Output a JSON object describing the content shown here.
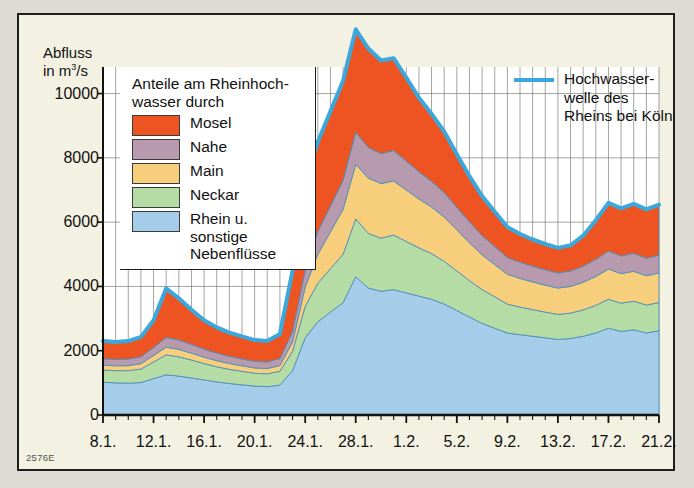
{
  "figure": {
    "code": "2576E",
    "background": "#f3f1e2",
    "frame_color": "#1d1d1b"
  },
  "legend_left": {
    "title": "Anteile am Rheinhoch-\nwasser durch",
    "items": [
      {
        "label": "Mosel",
        "color": "#ee5422"
      },
      {
        "label": "Nahe",
        "color": "#b79aad"
      },
      {
        "label": "Main",
        "color": "#f7cf7c"
      },
      {
        "label": "Neckar",
        "color": "#b6dca6"
      },
      {
        "label": "Rhein u. sonstige\nNebenflüsse",
        "color": "#a5cce9"
      }
    ]
  },
  "legend_right": {
    "label": "Hochwasser-\nwelle des\nRheins bei Köln",
    "color": "#3aa8dc"
  },
  "chart_data": {
    "type": "area",
    "stacked": true,
    "title": "",
    "ylabel": "Abfluss\nin m3/s",
    "ylabel_html": "Abfluss in m<sup>3</sup>/s",
    "xlabel": "",
    "ylim": [
      0,
      11200
    ],
    "yticks": [
      0,
      2000,
      4000,
      6000,
      8000,
      10000
    ],
    "ytick_labels": [
      "0",
      "2000",
      "4000",
      "6000",
      "8000",
      "10000"
    ],
    "grid": true,
    "grid_x": "every day",
    "grid_y": "every 2000",
    "x": [
      "8.1.",
      "9.1.",
      "10.1.",
      "11.1.",
      "12.1.",
      "13.1.",
      "14.1.",
      "15.1.",
      "16.1.",
      "17.1.",
      "18.1.",
      "19.1.",
      "20.1.",
      "21.1.",
      "22.1.",
      "23.1.",
      "24.1.",
      "25.1.",
      "26.1.",
      "27.1.",
      "28.1.",
      "29.1.",
      "30.1.",
      "31.1.",
      "1.2.",
      "2.2.",
      "3.2.",
      "4.2.",
      "5.2.",
      "6.2.",
      "7.2.",
      "8.2.",
      "9.2.",
      "10.2.",
      "11.2.",
      "12.2.",
      "13.2.",
      "14.2.",
      "15.2.",
      "16.2.",
      "17.2.",
      "18.2.",
      "19.2.",
      "20.2.",
      "21.2."
    ],
    "xtick_labels": [
      "8.1.",
      "12.1.",
      "16.1.",
      "20.1.",
      "24.1.",
      "28.1.",
      "1.2.",
      "5.2.",
      "9.2.",
      "13.2.",
      "17.2.",
      "21.2."
    ],
    "xtick_every": 4,
    "series": [
      {
        "name": "Rhein u. sonstige Nebenflüsse",
        "color": "#a5cce9",
        "values": [
          1020,
          1000,
          990,
          1010,
          1130,
          1250,
          1210,
          1150,
          1090,
          1030,
          980,
          940,
          900,
          880,
          930,
          1380,
          2400,
          2900,
          3200,
          3500,
          4300,
          3950,
          3850,
          3900,
          3800,
          3700,
          3600,
          3450,
          3250,
          3050,
          2850,
          2700,
          2550,
          2500,
          2450,
          2400,
          2350,
          2380,
          2450,
          2550,
          2700,
          2600,
          2650,
          2550,
          2620
        ]
      },
      {
        "name": "Neckar",
        "color": "#b6dca6",
        "values": [
          380,
          380,
          390,
          420,
          520,
          620,
          600,
          560,
          510,
          470,
          440,
          420,
          400,
          400,
          430,
          600,
          980,
          1200,
          1350,
          1500,
          1800,
          1700,
          1650,
          1700,
          1600,
          1500,
          1420,
          1330,
          1230,
          1130,
          1050,
          980,
          900,
          860,
          830,
          800,
          780,
          790,
          820,
          860,
          900,
          880,
          890,
          870,
          880
        ]
      },
      {
        "name": "Main",
        "color": "#f7cf7c",
        "values": [
          150,
          150,
          155,
          165,
          200,
          240,
          230,
          215,
          200,
          190,
          180,
          170,
          165,
          165,
          180,
          290,
          600,
          900,
          1150,
          1400,
          1700,
          1720,
          1700,
          1680,
          1600,
          1520,
          1450,
          1380,
          1280,
          1180,
          1080,
          1000,
          930,
          890,
          860,
          840,
          820,
          830,
          860,
          900,
          940,
          920,
          930,
          910,
          920
        ]
      },
      {
        "name": "Nahe",
        "color": "#b79aad",
        "values": [
          200,
          200,
          205,
          215,
          250,
          300,
          290,
          270,
          250,
          235,
          225,
          215,
          205,
          205,
          220,
          320,
          520,
          700,
          800,
          900,
          1000,
          950,
          930,
          950,
          900,
          850,
          800,
          760,
          700,
          650,
          600,
          560,
          520,
          500,
          490,
          480,
          470,
          480,
          500,
          530,
          560,
          550,
          560,
          545,
          555
        ]
      },
      {
        "name": "Mosel",
        "color": "#ee5422",
        "values": [
          550,
          540,
          560,
          620,
          850,
          1530,
          1300,
          1080,
          900,
          800,
          740,
          700,
          660,
          650,
          760,
          1900,
          2800,
          2800,
          2950,
          3100,
          3200,
          3080,
          2900,
          2870,
          2600,
          2300,
          2100,
          1900,
          1650,
          1420,
          1230,
          1080,
          950,
          880,
          830,
          800,
          780,
          800,
          950,
          1220,
          1500,
          1480,
          1540,
          1520,
          1570
        ]
      }
    ],
    "total_line": {
      "name": "Hochwasserwelle des Rheins bei Köln",
      "color": "#3aa8dc",
      "values": [
        2300,
        2270,
        2300,
        2430,
        2950,
        3940,
        3630,
        3275,
        2950,
        2725,
        2565,
        2445,
        2330,
        2300,
        2520,
        4490,
        7300,
        8500,
        9450,
        10400,
        12000,
        11400,
        11030,
        11100,
        10500,
        9870,
        9370,
        8820,
        8110,
        7430,
        6810,
        6320,
        5850,
        5630,
        5460,
        5320,
        5200,
        5280,
        5580,
        6060,
        6600,
        6430,
        6570,
        6395,
        6545
      ]
    }
  }
}
